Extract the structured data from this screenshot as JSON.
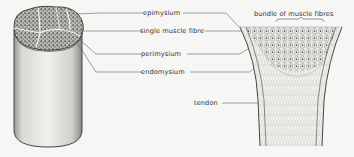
{
  "diagram": {
    "colors": {
      "background": "#f6f6f4",
      "ink": "#333333",
      "line": "#555555",
      "fill_light": "#e4e4e0"
    },
    "left_figure": {
      "name": "muscle cross-section cylinder",
      "labels": [
        {
          "id": "epimysium",
          "text": "epimysium"
        },
        {
          "id": "single-muscle-fibre",
          "text": "single muscle fibre"
        },
        {
          "id": "perimysium",
          "text": "perimysium"
        },
        {
          "id": "endomysium",
          "text": "endomysium"
        }
      ]
    },
    "right_figure": {
      "name": "muscle to tendon transition",
      "labels": [
        {
          "id": "bundle",
          "text": "bundle of muscle fibres"
        },
        {
          "id": "tendon",
          "text": "tendon"
        }
      ]
    }
  }
}
